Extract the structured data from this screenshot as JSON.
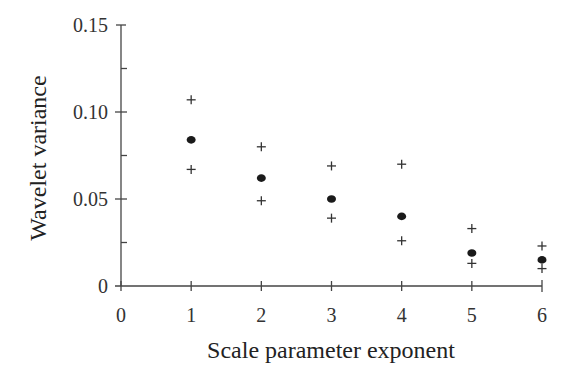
{
  "chart_data": {
    "type": "scatter",
    "title": "",
    "xlabel": "Scale parameter exponent",
    "ylabel": "Wavelet variance",
    "xlim": [
      0,
      6
    ],
    "ylim": [
      0,
      0.15
    ],
    "xticks": [
      0,
      1,
      2,
      3,
      4,
      5,
      6
    ],
    "xtick_labels": [
      "0",
      "1",
      "2",
      "3",
      "4",
      "5",
      "6"
    ],
    "yticks_major": [
      0,
      0.05,
      0.1,
      0.15
    ],
    "ytick_labels": [
      "0",
      "0.05",
      "0.10",
      "0.15"
    ],
    "yticks_minor": [
      0.025,
      0.075,
      0.125
    ],
    "grid": false,
    "legend": null,
    "x": [
      1,
      2,
      3,
      4,
      5,
      6
    ],
    "series": [
      {
        "name": "estimate",
        "marker": "filled-circle",
        "values": [
          0.084,
          0.062,
          0.05,
          0.04,
          0.019,
          0.015
        ]
      },
      {
        "name": "upper bound",
        "marker": "plus",
        "values": [
          0.107,
          0.08,
          0.069,
          0.07,
          0.033,
          0.023
        ]
      },
      {
        "name": "lower bound",
        "marker": "plus",
        "values": [
          0.067,
          0.049,
          0.039,
          0.026,
          0.013,
          0.01
        ]
      }
    ]
  }
}
